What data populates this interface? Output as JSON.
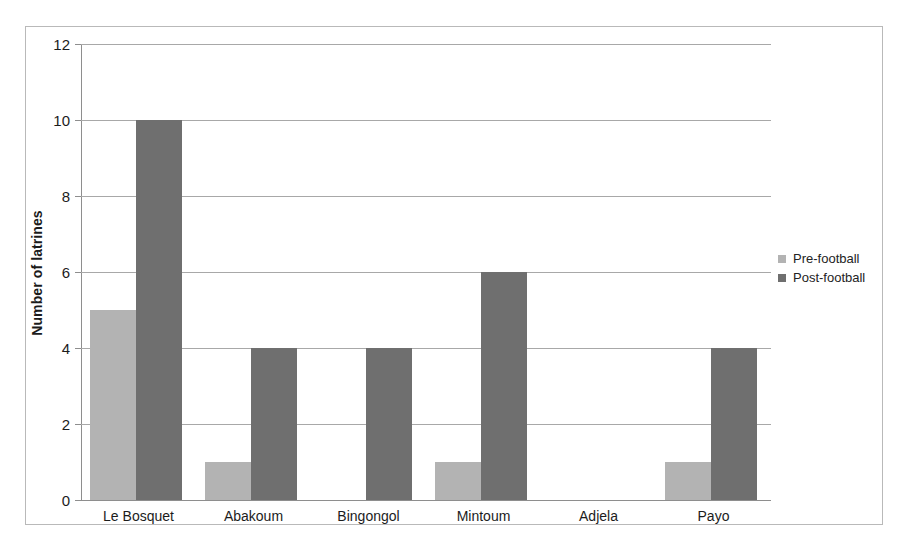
{
  "chart_data": {
    "type": "bar",
    "title": "",
    "xlabel": "",
    "ylabel": "Number of latrines",
    "ylim": [
      0,
      12
    ],
    "ytick_values": [
      0,
      2,
      4,
      6,
      8,
      10,
      12
    ],
    "ytick_labels": [
      "0",
      "2",
      "4",
      "6",
      "8",
      "10",
      "12"
    ],
    "grid": true,
    "legend_position": "right",
    "categories": [
      "Le Bosquet",
      "Abakoum",
      "Bingongol",
      "Mintoum",
      "Adjela",
      "Payo"
    ],
    "series": [
      {
        "name": "Pre-football",
        "color": "#b3b3b3",
        "values": [
          5,
          1,
          0,
          1,
          0,
          1
        ]
      },
      {
        "name": "Post-football",
        "color": "#6f6f6f",
        "values": [
          10,
          4,
          4,
          6,
          0,
          4
        ]
      }
    ]
  },
  "figure": {
    "frame_color": "#b9b9b9",
    "gridline_color": "#a8a8a8",
    "axis_color": "#8e8e8e",
    "background": "#ffffff"
  }
}
